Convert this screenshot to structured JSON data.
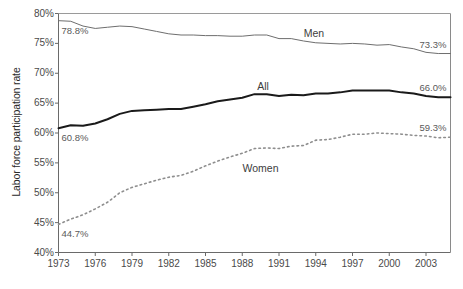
{
  "chart_data": {
    "type": "line",
    "title": "",
    "xlabel": "",
    "ylabel": "Labor force participation rate",
    "xlim": [
      1973,
      2005
    ],
    "ylim": [
      40,
      80
    ],
    "ytick_suffix": "%",
    "grid": false,
    "legend": "inline-labels",
    "yticks": [
      "40%",
      "45%",
      "50%",
      "55%",
      "60%",
      "65%",
      "70%",
      "75%",
      "80%"
    ],
    "ytick_values": [
      40,
      45,
      50,
      55,
      60,
      65,
      70,
      75,
      80
    ],
    "xticks": [
      "1973",
      "1976",
      "1979",
      "1982",
      "1985",
      "1988",
      "1991",
      "1994",
      "1997",
      "2000",
      "2003"
    ],
    "xtick_values": [
      1973,
      1976,
      1979,
      1982,
      1985,
      1988,
      1991,
      1994,
      1997,
      2000,
      2003
    ],
    "x": [
      1973,
      1974,
      1975,
      1976,
      1977,
      1978,
      1979,
      1980,
      1981,
      1982,
      1983,
      1984,
      1985,
      1986,
      1987,
      1988,
      1989,
      1990,
      1991,
      1992,
      1993,
      1994,
      1995,
      1996,
      1997,
      1998,
      1999,
      2000,
      2001,
      2002,
      2003,
      2004,
      2005
    ],
    "series": [
      {
        "name": "Men",
        "color": "#6e6e6e",
        "style": "solid",
        "width": 1,
        "label_x": 1994.0,
        "label_y": 76.6,
        "start_label": "78.8%",
        "end_label": "73.3%",
        "values": [
          78.8,
          78.7,
          77.9,
          77.5,
          77.7,
          77.9,
          77.8,
          77.4,
          77.0,
          76.6,
          76.4,
          76.4,
          76.3,
          76.3,
          76.2,
          76.2,
          76.4,
          76.4,
          75.8,
          75.8,
          75.4,
          75.1,
          75.0,
          74.9,
          75.0,
          74.9,
          74.7,
          74.8,
          74.4,
          74.1,
          73.5,
          73.3,
          73.3
        ]
      },
      {
        "name": "All",
        "color": "#1a1a1a",
        "style": "solid",
        "width": 2,
        "label_x": 1990.2,
        "label_y": 67.7,
        "start_label": "60.8%",
        "end_label": "66.0%",
        "values": [
          60.8,
          61.3,
          61.2,
          61.6,
          62.3,
          63.2,
          63.7,
          63.8,
          63.9,
          64.0,
          64.0,
          64.4,
          64.8,
          65.3,
          65.6,
          65.9,
          66.5,
          66.5,
          66.2,
          66.4,
          66.3,
          66.6,
          66.6,
          66.8,
          67.1,
          67.1,
          67.1,
          67.1,
          66.8,
          66.6,
          66.2,
          66.0,
          66.0
        ]
      },
      {
        "name": "Women",
        "color": "#8e8e8e",
        "style": "dotted",
        "width": 1.6,
        "label_x": 1989.0,
        "label_y": 53.9,
        "start_label": "44.7%",
        "end_label": "59.3%",
        "values": [
          44.7,
          45.6,
          46.3,
          47.3,
          48.4,
          50.0,
          50.9,
          51.5,
          52.1,
          52.6,
          52.9,
          53.6,
          54.5,
          55.3,
          56.0,
          56.6,
          57.4,
          57.5,
          57.4,
          57.8,
          57.9,
          58.8,
          58.9,
          59.3,
          59.8,
          59.8,
          60.0,
          59.9,
          59.8,
          59.6,
          59.5,
          59.2,
          59.3
        ]
      }
    ]
  },
  "labels": {
    "yaxis_title": "Labor force participation rate"
  }
}
